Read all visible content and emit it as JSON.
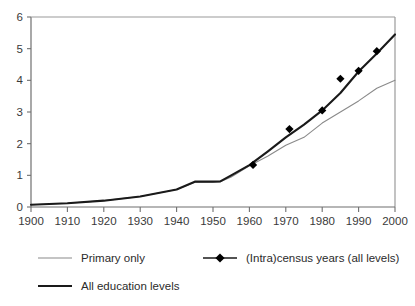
{
  "chart_data": {
    "type": "line",
    "title": "",
    "subtitle": "",
    "xlabel": "",
    "ylabel": "",
    "xlim": [
      1900,
      2000
    ],
    "ylim": [
      0,
      6
    ],
    "xticks": [
      1900,
      1910,
      1920,
      1930,
      1940,
      1950,
      1960,
      1970,
      1980,
      1990,
      2000
    ],
    "xtick_labels": [
      "1900",
      "1910",
      "1920",
      "1930",
      "1940",
      "1950",
      "1960",
      "1970",
      "1980",
      "1990",
      "2000"
    ],
    "yticks": [
      0,
      1,
      2,
      3,
      4,
      5,
      6
    ],
    "ytick_labels": [
      "0",
      "1",
      "2",
      "3",
      "4",
      "5",
      "6"
    ],
    "grid": false,
    "legend_position": "below",
    "series": [
      {
        "name": "Primary only",
        "style": "thin-line",
        "color": "#8a8a8a",
        "x": [
          1900,
          1910,
          1920,
          1930,
          1940,
          1945,
          1950,
          1952,
          1955,
          1960,
          1965,
          1970,
          1975,
          1980,
          1985,
          1990,
          1995,
          2000
        ],
        "values": [
          0.07,
          0.12,
          0.2,
          0.33,
          0.55,
          0.78,
          0.79,
          0.8,
          0.95,
          1.3,
          1.6,
          1.95,
          2.2,
          2.65,
          3.0,
          3.35,
          3.75,
          4.0
        ]
      },
      {
        "name": "All education levels",
        "style": "thick-line",
        "color": "#1a1a1a",
        "x": [
          1900,
          1910,
          1920,
          1930,
          1940,
          1945,
          1950,
          1952,
          1955,
          1960,
          1965,
          1970,
          1975,
          1980,
          1985,
          1990,
          1995,
          2000
        ],
        "values": [
          0.07,
          0.12,
          0.2,
          0.33,
          0.55,
          0.8,
          0.8,
          0.81,
          1.0,
          1.32,
          1.75,
          2.2,
          2.6,
          3.05,
          3.6,
          4.28,
          4.85,
          5.45
        ]
      },
      {
        "name": "(Intra)census years (all levels)",
        "style": "markers",
        "color": "#000000",
        "x": [
          1961,
          1971,
          1980,
          1985,
          1990,
          1995
        ],
        "values": [
          1.33,
          2.46,
          3.05,
          4.05,
          4.3,
          4.92
        ]
      }
    ]
  },
  "legend": {
    "entries": [
      {
        "label": "Primary only",
        "marker": "thin-line"
      },
      {
        "label": "(Intra)census years (all levels)",
        "marker": "line-with-diamond"
      },
      {
        "label": "All education levels",
        "marker": "thick-line"
      }
    ]
  }
}
